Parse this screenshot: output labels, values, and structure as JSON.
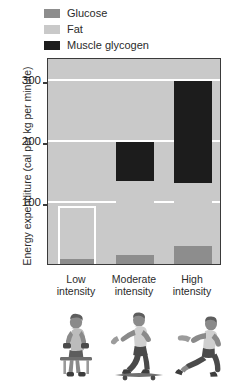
{
  "chart_data": {
    "type": "bar",
    "subtype": "stacked-bar",
    "title": "",
    "xlabel": "",
    "ylabel": "Energy expenditure (cal per kg per minute)",
    "categories": [
      "Low intensity",
      "Moderate intensity",
      "High intensity"
    ],
    "category_lines": [
      [
        "Low",
        "intensity"
      ],
      [
        "Moderate",
        "intensity"
      ],
      [
        "High",
        "intensity"
      ]
    ],
    "series": [
      {
        "name": "Glucose",
        "color": "#8d8d8d",
        "values": [
          8,
          15,
          30
        ]
      },
      {
        "name": "Fat",
        "color": "#c9c9c9",
        "values": [
          87,
          122,
          103
        ]
      },
      {
        "name": "Muscle glycogen",
        "color": "#1c1c1c",
        "values": [
          0,
          63,
          167
        ]
      }
    ],
    "totals": [
      95,
      200,
      300
    ],
    "ylim": [
      0,
      340
    ],
    "yticks": [
      100,
      200,
      300
    ],
    "ytick_labels": [
      "100",
      "200",
      "300"
    ],
    "grid": true,
    "grid_color": "#ffffff",
    "plot_background": "#c9c9c9",
    "axis_color": "#3a3a3a",
    "legend_position": "top-left"
  },
  "legend": {
    "items": [
      {
        "label": "Glucose",
        "color": "#8d8d8d"
      },
      {
        "label": "Fat",
        "color": "#c9c9c9"
      },
      {
        "label": "Muscle glycogen",
        "color": "#1c1c1c"
      }
    ]
  },
  "figures": [
    {
      "name": "seated-dumbbell-exercise",
      "caption": "Low intensity"
    },
    {
      "name": "skateboarding",
      "caption": "Moderate intensity"
    },
    {
      "name": "sprinting-runner",
      "caption": "High intensity"
    }
  ]
}
